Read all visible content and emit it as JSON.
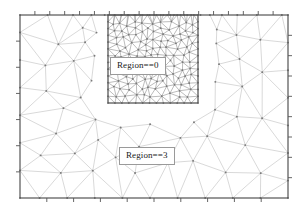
{
  "figure": {
    "type": "triangular-finite-element-mesh",
    "background_color": "#ffffff",
    "frame": {
      "x": 20,
      "y": 15,
      "width": 268,
      "height": 183,
      "stroke_color": "#555555",
      "stroke_width": 1.1,
      "tick_color": "#555555",
      "tick_length": 4,
      "ticks_top": 18,
      "ticks_bottom": 10,
      "ticks_left": 7,
      "ticks_right": 9
    },
    "refinement_box": {
      "x": 108,
      "y": 15,
      "width": 90,
      "height": 88,
      "stroke_color": "#555555",
      "stroke_width": 1.1
    },
    "mesh_style": {
      "edge_color": "#b9b9b9",
      "edge_color_dense": "#8f8f8f",
      "edge_width": 0.55,
      "vertex_color": "#7a7a7a",
      "vertex_radius": 0.85
    }
  },
  "labels": {
    "region_refined": "Region==0",
    "region_coarse": "Region==3"
  },
  "chart_data": {
    "type": "mesh",
    "title": "",
    "xlabel": "",
    "ylabel": "",
    "regions": [
      {
        "name": "Region==0",
        "description": "Refined triangular mesh sub-domain (upper middle)",
        "bounds": [
          108,
          15,
          198,
          103
        ],
        "element_density": "fine"
      },
      {
        "name": "Region==3",
        "description": "Coarse triangular mesh outer domain",
        "bounds": [
          20,
          15,
          288,
          198
        ],
        "element_density": "coarse"
      }
    ],
    "legend_position": "inline-annotation",
    "grid": false
  }
}
